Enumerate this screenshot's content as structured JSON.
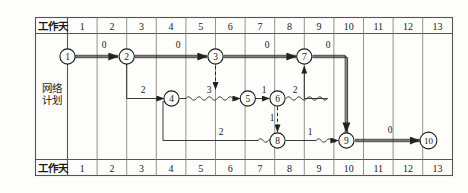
{
  "labels": {
    "header_row_label": "工作天",
    "footer_row_label": "工作天",
    "side_label_line1": "网络",
    "side_label_line2": "计划"
  },
  "colors": {
    "grid_line": "#555555",
    "border": "#444444",
    "text": "#1a1a1a",
    "arrow": "#222222",
    "critical_path": "#333333",
    "background": "#fdfdfb"
  },
  "axis": {
    "columns": [
      "1",
      "2",
      "3",
      "4",
      "5",
      "6",
      "7",
      "8",
      "9",
      "10",
      "11",
      "12",
      "13"
    ],
    "day_min": 0,
    "day_max": 13
  },
  "nodes": [
    {
      "id": "1",
      "label": "1",
      "day": 0,
      "row": "top"
    },
    {
      "id": "2",
      "label": "2",
      "day": 3,
      "row": "top"
    },
    {
      "id": "3",
      "label": "3",
      "day": 6,
      "row": "top"
    },
    {
      "id": "7",
      "label": "7",
      "day": 9,
      "row": "top"
    },
    {
      "id": "4",
      "label": "4",
      "day": 4,
      "row": "mid"
    },
    {
      "id": "5",
      "label": "5",
      "day": 7,
      "row": "mid"
    },
    {
      "id": "6",
      "label": "6",
      "day": 8,
      "row": "mid"
    },
    {
      "id": "8",
      "label": "8",
      "day": 8,
      "row": "bot"
    },
    {
      "id": "9",
      "label": "9",
      "day": 11,
      "row": "bot"
    },
    {
      "id": "10",
      "label": "10",
      "day": 13,
      "row": "bot"
    }
  ],
  "edges": [
    {
      "from": "1",
      "to": "2",
      "label": "0",
      "style": "critical",
      "kind": "straight"
    },
    {
      "from": "2",
      "to": "3",
      "label": "0",
      "style": "critical",
      "kind": "straight"
    },
    {
      "from": "3",
      "to": "7",
      "label": "0",
      "style": "critical",
      "kind": "straight"
    },
    {
      "from": "7",
      "to": "9",
      "label": "0",
      "style": "critical",
      "kind": "elbow-down"
    },
    {
      "from": "2",
      "to": "4",
      "label": "2",
      "style": "normal",
      "kind": "drop-then-right"
    },
    {
      "from": "4",
      "to": "5",
      "label": "3",
      "style": "normal",
      "kind": "wavy"
    },
    {
      "from": "5",
      "to": "6",
      "label": "1",
      "style": "normal",
      "kind": "straight"
    },
    {
      "from": "6",
      "to": "8",
      "label": "2",
      "style": "normal",
      "kind": "wavy-then-up"
    },
    {
      "from": "3",
      "to": "5",
      "label": "",
      "style": "dashed",
      "kind": "vertical-down"
    },
    {
      "from": "6",
      "to": "8",
      "label": "1",
      "style": "dashed",
      "kind": "vertical-down"
    },
    {
      "from": "4",
      "to": "8",
      "label": "2",
      "style": "normal",
      "kind": "drop-then-right-wavy"
    },
    {
      "from": "8",
      "to": "9",
      "label": "1",
      "style": "normal",
      "kind": "wavy"
    },
    {
      "from": "9",
      "to": "10",
      "label": "0",
      "style": "critical",
      "kind": "straight"
    }
  ],
  "edge_labels": {
    "l1_2": "0",
    "l2_3": "0",
    "l3_7": "0",
    "l7_9": "0",
    "l2_4": "2",
    "l4_5": "3",
    "l5_6": "1",
    "l6_7": "2",
    "l6_8": "1",
    "l4_8": "2",
    "l8_9": "1",
    "l9_10": "0"
  }
}
